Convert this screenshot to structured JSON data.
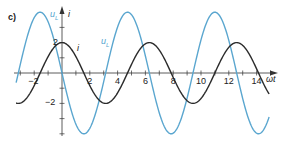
{
  "figure": {
    "part_label": "c)",
    "x_axis_label": "ωt",
    "y_axis_label_u": "u",
    "y_axis_label_u_sub": "L",
    "y_axis_label_i": "i",
    "curve_label_i": "i",
    "curve_label_u": "u",
    "curve_label_u_sub": "L"
  },
  "colors": {
    "axis": "#333333",
    "i_curve": "#2b2b2b",
    "u_curve": "#5aa6cf"
  },
  "chart_data": {
    "type": "line",
    "title": "",
    "xlabel": "ωt",
    "ylabel": "u_L, i",
    "xlim": [
      -3.3,
      15.3
    ],
    "ylim": [
      -4.2,
      4.2
    ],
    "x_ticks": [
      -2,
      2,
      4,
      6,
      8,
      10,
      12,
      14
    ],
    "x_minor_step": 1,
    "y_ticks": [
      2,
      -2
    ],
    "y_minor_step": 1,
    "grid": false,
    "legend": "inline labels",
    "series": [
      {
        "name": "i",
        "formula": "2*cos(ωt)",
        "amplitude": 2,
        "color": "#2b2b2b",
        "x": [
          -3,
          -1.57,
          0,
          1.57,
          3.14,
          4.71,
          6.28,
          7.85,
          9.42,
          11.0,
          12.57,
          14.14,
          14.8
        ],
        "values": [
          -1.98,
          0,
          2,
          0,
          -2,
          0,
          2,
          0,
          -2,
          0,
          2,
          0,
          -1.2
        ]
      },
      {
        "name": "u_L",
        "formula": "-4*sin(ωt)",
        "amplitude": 4,
        "color": "#5aa6cf",
        "x": [
          -3,
          -1.57,
          0,
          1.57,
          3.14,
          4.71,
          6.28,
          7.85,
          9.42,
          11.0,
          12.57,
          14.14,
          14.8
        ],
        "values": [
          0.56,
          4,
          0,
          -4,
          0,
          4,
          0,
          -4,
          0,
          4,
          0,
          -4,
          -3.2
        ]
      }
    ],
    "annotations": [
      "c)",
      "u_L",
      "i"
    ]
  }
}
